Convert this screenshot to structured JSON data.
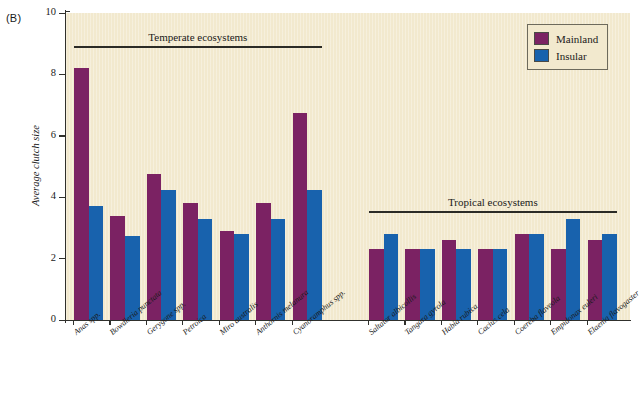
{
  "panel": {
    "letter": "(B)"
  },
  "chart_data": {
    "type": "bar",
    "title": "",
    "xlabel": "",
    "ylabel": "Average clutch size",
    "ylim": [
      0,
      10
    ],
    "yticks": [
      0,
      2,
      4,
      6,
      8,
      10
    ],
    "ytick_labels": [
      "0",
      "2",
      "4",
      "6",
      "8",
      "10"
    ],
    "grid": false,
    "legend_position": "top-right",
    "legend": [
      "Mainland",
      "Insular"
    ],
    "colors": {
      "mainland": "#7b2263",
      "insular": "#1862ad",
      "plot_background": "#f2e9ce",
      "axis": "#30302c"
    },
    "groups": [
      {
        "name": "Temperate ecosystems",
        "categories": [
          "Anas spp.",
          "Bowdleria punctata",
          "Gerygone spp.",
          "Petroica",
          "Miro australis",
          "Anthornis melanura",
          "Cyanoramphus spp."
        ],
        "series": [
          {
            "name": "Mainland",
            "values": [
              8.2,
              3.4,
              4.75,
              3.8,
              2.9,
              3.8,
              6.75
            ]
          },
          {
            "name": "Insular",
            "values": [
              3.7,
              2.75,
              4.25,
              3.3,
              2.8,
              3.3,
              4.25
            ]
          }
        ]
      },
      {
        "name": "Tropical ecosystems",
        "categories": [
          "Saltator albicollis",
          "Tangara gyrola",
          "Habia rubica",
          "Cacius cela",
          "Coereba flaveola",
          "Empidonax euleri",
          "Elaenia flavogaster"
        ],
        "series": [
          {
            "name": "Mainland",
            "values": [
              2.3,
              2.3,
              2.6,
              2.3,
              2.8,
              2.3,
              2.6
            ]
          },
          {
            "name": "Insular",
            "values": [
              2.8,
              2.3,
              2.3,
              2.3,
              2.8,
              3.3,
              2.8
            ]
          }
        ]
      }
    ]
  }
}
